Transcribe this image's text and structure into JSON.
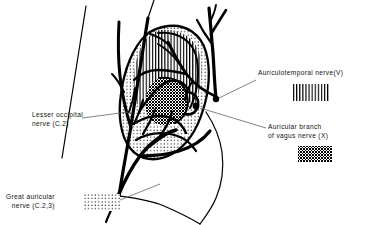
{
  "figure": {
    "ink_color": "#000000",
    "background": "#ffffff"
  },
  "labels": {
    "auriculotemporal": {
      "name": "auriculotemporal-nerve-label",
      "line1": "Auriculotemporal  nerve(V)",
      "pattern": "vertical-lines"
    },
    "auricular_vagus": {
      "name": "auricular-branch-vagus-label",
      "line1": "Auricular  branch",
      "line2": "of  vagus  nerve (X)",
      "pattern": "cross-hatch"
    },
    "lesser_occipital": {
      "name": "lesser-occipital-nerve-label",
      "line1": "Lesser  occipital",
      "line2": "nerve (C.2)",
      "pattern": "none"
    },
    "great_auricular": {
      "name": "great-auricular-nerve-label",
      "line1": "Great    auricular",
      "line2": "nerve (C.2,3)",
      "pattern": "dots"
    }
  },
  "legend_swatches": [
    {
      "key": "vertical-lines",
      "for": "Auriculotemporal  nerve(V)"
    },
    {
      "key": "cross-hatch",
      "for": "of  vagus  nerve (X)"
    },
    {
      "key": "dots",
      "for": "nerve (C.2,3)"
    }
  ],
  "regions": [
    {
      "name": "helix-scapha-upper-auricle",
      "pattern": "vertical-lines",
      "nerve": "Auriculotemporal  nerve(V)"
    },
    {
      "name": "concha-tragus",
      "pattern": "cross-hatch",
      "nerve": "of  vagus  nerve (X)"
    },
    {
      "name": "outer-rim-and-lobule",
      "pattern": "dots",
      "nerve": "nerve (C.2,3)"
    }
  ]
}
